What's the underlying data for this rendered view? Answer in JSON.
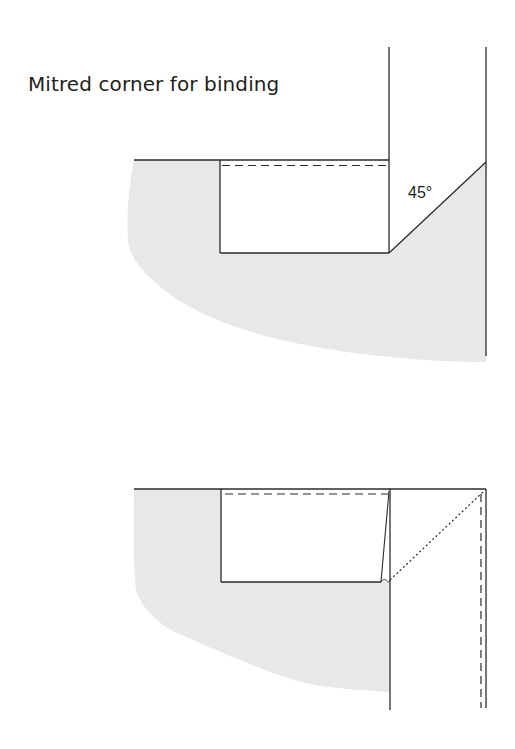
{
  "title": "Mitred corner for binding",
  "colors": {
    "line": "#2b2b2b",
    "fill": "#e8e8e8",
    "background": "#ffffff"
  },
  "diagrams": [
    {
      "id": "step-1",
      "angle_label": "45°"
    },
    {
      "id": "step-2"
    }
  ]
}
